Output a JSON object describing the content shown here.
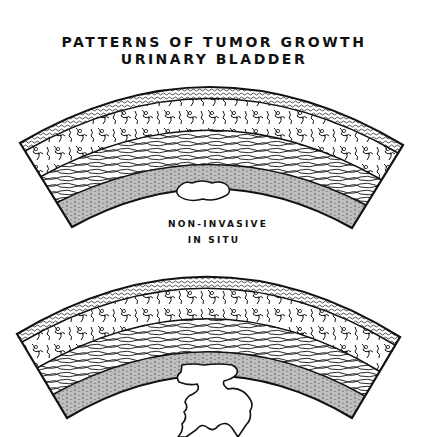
{
  "figure": {
    "title_line1": "PATTERNS OF TUMOR GROWTH",
    "title_line2": "URINARY BLADDER",
    "panels": [
      {
        "name": "non-invasive-in-situ",
        "label_line1": "NON-INVASIVE",
        "label_line2": "IN SITU",
        "description": "Cross-section of bladder wall arc with small tumor confined within the inner layer"
      },
      {
        "name": "exophytic-growth",
        "label_line1": "",
        "label_line2": "",
        "description": "Cross-section of bladder wall arc with tumor projecting outward beyond the inner layer"
      }
    ],
    "layers": [
      "serosa (stippled)",
      "muscularis outer (irregular)",
      "muscularis inner (fibrous)",
      "mucosa / urothelium (stratified)"
    ],
    "colors": {
      "ink": "#111111",
      "background": "#ffffff"
    }
  }
}
